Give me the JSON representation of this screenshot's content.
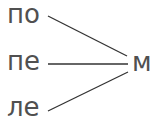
{
  "diagram": {
    "left_items": [
      {
        "label": "по"
      },
      {
        "label": "пе"
      },
      {
        "label": "ле"
      }
    ],
    "right_item": {
      "label": "м"
    },
    "colors": {
      "text": "#505050",
      "line": "#333333",
      "background": "#ffffff"
    }
  }
}
